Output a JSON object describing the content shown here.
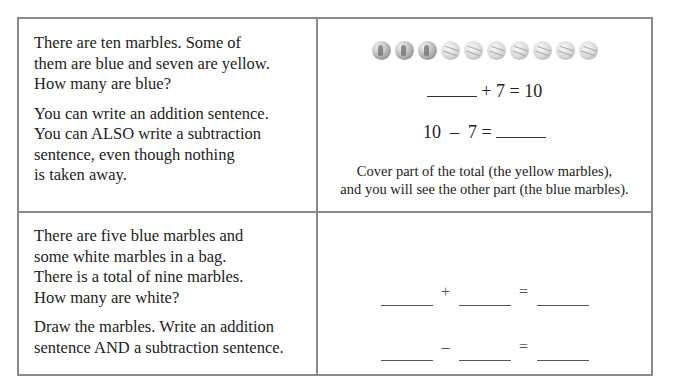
{
  "problems": [
    {
      "question_lines": [
        "There are ten marbles. Some of",
        "them are blue and seven are yellow.",
        "How many are blue?"
      ],
      "instruction_lines": [
        "You can write an addition sentence.",
        "You can ALSO write a subtraction",
        "sentence, even though nothing",
        "is taken away."
      ],
      "illustration": {
        "marbles": [
          {
            "color": "blue"
          },
          {
            "color": "blue"
          },
          {
            "color": "blue"
          },
          {
            "color": "yellow"
          },
          {
            "color": "yellow"
          },
          {
            "color": "yellow"
          },
          {
            "color": "yellow"
          },
          {
            "color": "yellow"
          },
          {
            "color": "yellow"
          },
          {
            "color": "yellow"
          }
        ],
        "addition_text": "+ 7 = 10",
        "subtraction_text": "10  –  7 =",
        "note_lines": [
          "Cover part of the total (the yellow marbles),",
          "and you will see the other part (the blue marbles)."
        ]
      }
    },
    {
      "question_lines": [
        "There are five blue marbles and",
        "some white marbles in a bag.",
        "There is a total of nine marbles.",
        "How many are white?"
      ],
      "instruction_lines": [
        "Draw the marbles. Write an addition",
        "sentence AND a subtraction sentence."
      ],
      "answer_area": {
        "addition_op": "+",
        "subtraction_op": "–",
        "equals": "="
      }
    }
  ]
}
